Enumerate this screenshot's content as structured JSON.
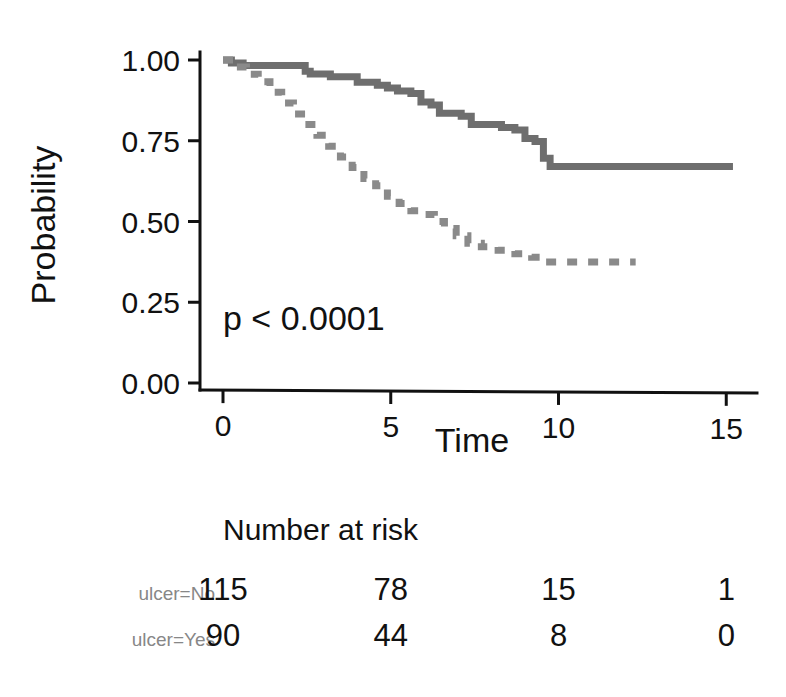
{
  "chart_data": {
    "type": "line",
    "title": "",
    "xlabel": "Time",
    "ylabel": "Probability",
    "xlim": [
      0,
      15.8
    ],
    "ylim": [
      0,
      1.0
    ],
    "xticks": [
      0,
      5,
      10,
      15
    ],
    "xtick_labels": [
      "0",
      "5",
      "10",
      "15"
    ],
    "yticks": [
      0.0,
      0.25,
      0.5,
      0.75,
      1.0
    ],
    "ytick_labels": [
      "0.00",
      "0.25",
      "0.50",
      "0.75",
      "1.00"
    ],
    "grid": false,
    "legend": "none",
    "annotations": [
      {
        "name": "p-value",
        "text": "p < 0.0001",
        "x": 0.6,
        "y": 0.24
      }
    ],
    "series": [
      {
        "name": "ulcer=No",
        "style": "solid",
        "color": "#6e6e6e",
        "step": "post",
        "points": [
          [
            0.0,
            1.0
          ],
          [
            0.25,
            0.991
          ],
          [
            0.6,
            0.983
          ],
          [
            2.35,
            0.983
          ],
          [
            2.45,
            0.965
          ],
          [
            2.6,
            0.957
          ],
          [
            3.2,
            0.948
          ],
          [
            3.9,
            0.948
          ],
          [
            4.0,
            0.931
          ],
          [
            4.6,
            0.922
          ],
          [
            4.9,
            0.913
          ],
          [
            5.2,
            0.904
          ],
          [
            5.6,
            0.896
          ],
          [
            5.9,
            0.87
          ],
          [
            6.2,
            0.861
          ],
          [
            6.45,
            0.835
          ],
          [
            7.1,
            0.826
          ],
          [
            7.4,
            0.8
          ],
          [
            8.3,
            0.791
          ],
          [
            8.7,
            0.783
          ],
          [
            9.0,
            0.757
          ],
          [
            9.3,
            0.748
          ],
          [
            9.55,
            0.696
          ],
          [
            9.75,
            0.67
          ],
          [
            15.2,
            0.67
          ]
        ]
      },
      {
        "name": "ulcer=Yes",
        "style": "dashed",
        "color": "#8a8a8a",
        "step": "post",
        "points": [
          [
            0.0,
            1.0
          ],
          [
            0.35,
            0.978
          ],
          [
            0.7,
            0.956
          ],
          [
            1.05,
            0.933
          ],
          [
            1.4,
            0.9
          ],
          [
            1.75,
            0.867
          ],
          [
            2.1,
            0.833
          ],
          [
            2.45,
            0.8
          ],
          [
            2.8,
            0.767
          ],
          [
            3.15,
            0.733
          ],
          [
            3.5,
            0.7
          ],
          [
            3.85,
            0.667
          ],
          [
            4.2,
            0.633
          ],
          [
            4.55,
            0.611
          ],
          [
            4.9,
            0.578
          ],
          [
            5.25,
            0.556
          ],
          [
            5.6,
            0.533
          ],
          [
            5.95,
            0.522
          ],
          [
            6.3,
            0.5
          ],
          [
            6.6,
            0.478
          ],
          [
            6.95,
            0.456
          ],
          [
            7.3,
            0.433
          ],
          [
            7.7,
            0.422
          ],
          [
            8.2,
            0.411
          ],
          [
            8.7,
            0.4
          ],
          [
            9.2,
            0.389
          ],
          [
            9.5,
            0.375
          ],
          [
            12.3,
            0.375
          ]
        ]
      }
    ]
  },
  "risk_table": {
    "title": "Number at risk",
    "time_points": [
      0,
      5,
      10,
      15
    ],
    "rows": [
      {
        "label": "ulcer=No",
        "values": [
          "115",
          "78",
          "15",
          "1"
        ]
      },
      {
        "label": "ulcer=Yes",
        "values": [
          "90",
          "44",
          "8",
          "0"
        ]
      }
    ]
  }
}
